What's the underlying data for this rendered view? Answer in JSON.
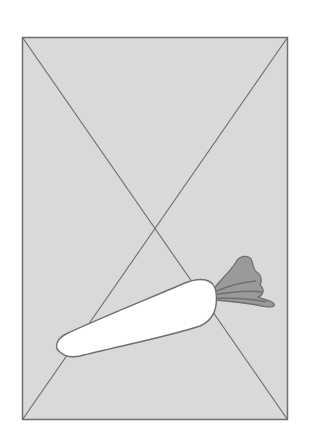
{
  "placeholder": {
    "icon": "carrot-icon",
    "background_color": "#d9d9d9",
    "border_color": "#6f6f6f",
    "carrot_body_color": "#ffffff",
    "carrot_leaves_color": "#9a9a9a"
  }
}
